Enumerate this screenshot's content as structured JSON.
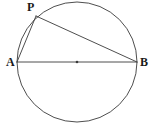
{
  "figure": {
    "width": 154,
    "height": 125,
    "background_color": "#ffffff",
    "stroke_color": "#3a3a3a",
    "label_color": "#1a1a1a",
    "stroke_width": 0.9
  },
  "labels": {
    "point_p": "P",
    "point_a": "A",
    "point_b": "B"
  },
  "chart_data": {
    "type": "diagram",
    "subtype": "euclidean-geometry",
    "circle": {
      "name": "circumcircle",
      "center_x": 77,
      "center_y": 62,
      "radius": 60
    },
    "center_marker": {
      "name": "center-dot",
      "x": 77,
      "y": 62,
      "radius": 1.3
    },
    "points": [
      {
        "id": "A",
        "label": "A",
        "x": 17,
        "y": 62,
        "label_x": 6,
        "label_y": 56,
        "on_circle": true
      },
      {
        "id": "B",
        "label": "B",
        "x": 137,
        "y": 62,
        "label_x": 140,
        "label_y": 56,
        "on_circle": true
      },
      {
        "id": "P",
        "label": "P",
        "x": 36,
        "y": 16,
        "label_x": 27,
        "label_y": 1,
        "on_circle": true
      }
    ],
    "segments": [
      {
        "id": "AB",
        "name": "diameter-ab",
        "from": "A",
        "to": "B",
        "x1": 17,
        "y1": 62,
        "x2": 137,
        "y2": 62,
        "role": "diameter"
      },
      {
        "id": "AP",
        "name": "chord-ap",
        "from": "A",
        "to": "P",
        "x1": 17,
        "y1": 62,
        "x2": 36,
        "y2": 16,
        "role": "chord"
      },
      {
        "id": "PB",
        "name": "chord-pb",
        "from": "P",
        "to": "B",
        "x1": 36,
        "y1": 16,
        "x2": 137,
        "y2": 62,
        "role": "chord"
      }
    ],
    "annotations": [],
    "legend": [],
    "grid": false
  }
}
